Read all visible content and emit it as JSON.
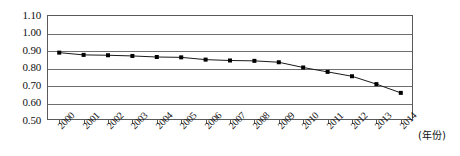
{
  "chart_data": {
    "type": "line",
    "title": "",
    "xlabel": "(年份)",
    "ylabel": "",
    "categories": [
      "2000",
      "2001",
      "2002",
      "2003",
      "2004",
      "2005",
      "2006",
      "2007",
      "2008",
      "2009",
      "2010",
      "2011",
      "2012",
      "2013",
      "2014"
    ],
    "values": [
      0.885,
      0.872,
      0.87,
      0.866,
      0.86,
      0.858,
      0.845,
      0.84,
      0.838,
      0.83,
      0.8,
      0.775,
      0.75,
      0.705,
      0.655
    ],
    "yticks": [
      "0.50",
      "0.60",
      "0.70",
      "0.80",
      "0.90",
      "1.00",
      "1.10"
    ],
    "ytick_values": [
      0.5,
      0.6,
      0.7,
      0.8,
      0.9,
      1.0,
      1.1
    ],
    "ylim": [
      0.5,
      1.1
    ],
    "grid": true,
    "legend": "none",
    "marker": "square",
    "marker_color": "#000000",
    "line_color": "#1a1a1a",
    "frame_color": "#5a5a5a",
    "background": "#ffffff"
  }
}
